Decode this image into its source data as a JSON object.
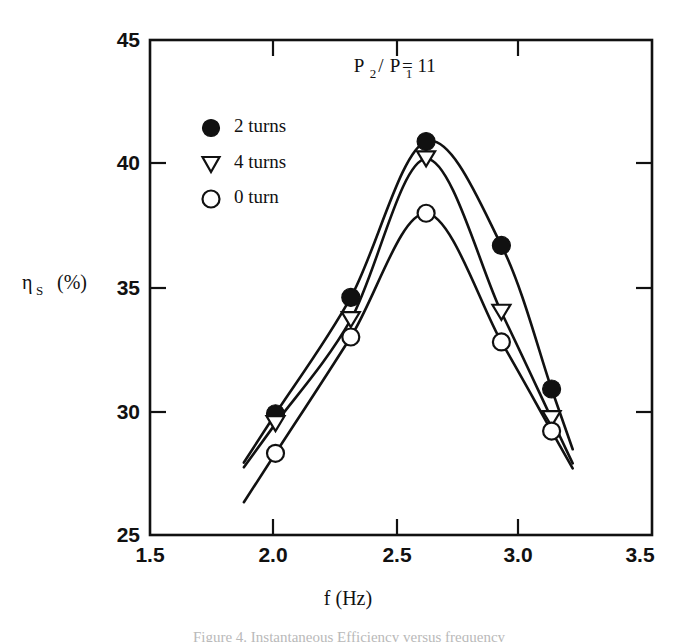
{
  "figure": {
    "caption": "Figure 4. Instantaneous Efficiency versus frequency",
    "background_color": "#ffffff",
    "ink_color": "#111111"
  },
  "chart_data": {
    "type": "line",
    "title": "",
    "subtitle": "",
    "xlabel": "f (Hz)",
    "ylabel_symbol": "η",
    "ylabel_subscript": "S",
    "ylabel_units": "(%)",
    "ylabel": "ηS (%)",
    "xlim": [
      1.5,
      3.5
    ],
    "ylim": [
      25,
      45
    ],
    "xticks": [
      1.5,
      2.0,
      2.5,
      3.0,
      3.5
    ],
    "xtick_labels": [
      "1.5",
      "2.0",
      "2.5",
      "3.0",
      "3.5"
    ],
    "yticks": [
      25,
      30,
      35,
      40,
      45
    ],
    "ytick_labels": [
      "25",
      "30",
      "35",
      "40",
      "45"
    ],
    "grid": false,
    "legend_position": "upper-left-inside",
    "annotations": [
      {
        "name": "pressure-ratio-annotation",
        "text": "P2 / P1 = 11",
        "parts": {
          "p_symbol": "P",
          "sub_2": "2",
          "slash": "/",
          "sub_1": "1",
          "equals_value": "= 11"
        },
        "x": 2.62,
        "y": 43.1
      }
    ],
    "x": [
      2.0,
      2.3,
      2.6,
      2.9,
      3.1
    ],
    "series": [
      {
        "name": "2 turns",
        "marker": "filled-circle",
        "values": [
          29.9,
          34.6,
          40.9,
          36.7,
          30.9
        ]
      },
      {
        "name": "4 turns",
        "marker": "open-down-triangle",
        "values": [
          29.5,
          33.7,
          40.2,
          34.0,
          29.7
        ]
      },
      {
        "name": "0 turn",
        "marker": "open-circle",
        "values": [
          28.3,
          33.0,
          38.0,
          32.8,
          29.2
        ]
      }
    ],
    "legend": [
      {
        "label": "2 turns",
        "marker": "filled-circle"
      },
      {
        "label": "4 turns",
        "marker": "open-down-triangle"
      },
      {
        "label": "0 turn",
        "marker": "open-circle"
      }
    ]
  }
}
